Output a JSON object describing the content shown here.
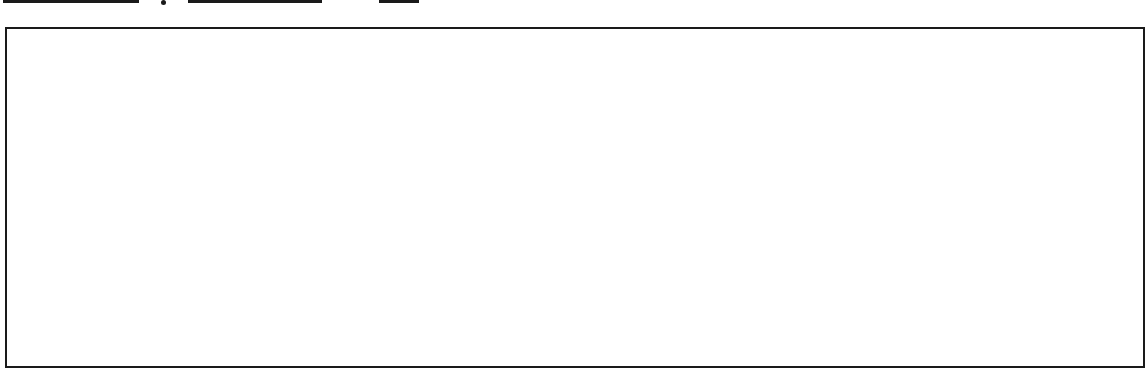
{
  "header": {
    "fields": [
      {
        "name": "blank-field-1",
        "value": ""
      },
      {
        "name": "blank-field-2",
        "value": ""
      },
      {
        "name": "blank-field-3",
        "value": ""
      }
    ],
    "separator": "."
  },
  "answer_box": {
    "content": ""
  },
  "colors": {
    "line": "#1a1a1a",
    "background": "#ffffff"
  }
}
